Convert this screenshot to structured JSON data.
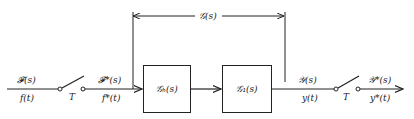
{
  "diagram": {
    "type": "block-diagram",
    "input": {
      "transform_label": "𝓕(s)",
      "time_label": "f(t)"
    },
    "input_switch": {
      "label": "T"
    },
    "sampled_input": {
      "transform_label": "𝓕*(s)",
      "time_label": "f*(t)"
    },
    "overall_bracket": {
      "label": "𝒢(s)"
    },
    "blocks": [
      {
        "id": "hold",
        "label": "𝒢ₕ(s)"
      },
      {
        "id": "plant",
        "label": "𝒢₁(s)"
      }
    ],
    "output": {
      "transform_label": "𝒴(s)",
      "time_label": "y(t)"
    },
    "output_switch": {
      "label": "T"
    },
    "sampled_output": {
      "transform_label": "𝒴*(s)",
      "time_label": "y*(t)"
    },
    "colors": {
      "stroke": "#222222",
      "background": "#ffffff"
    }
  }
}
